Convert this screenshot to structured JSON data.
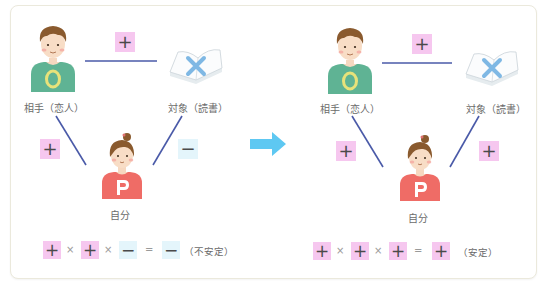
{
  "colors": {
    "plus_bg": "#f6c7ef",
    "minus_bg": "#e4f5fb",
    "line": "#4a5aa8",
    "arrow": "#5ec8f2",
    "partner_shirt": "#5fb394",
    "partner_ring": "#e8e27a",
    "self_shirt": "#ef6c66",
    "book_x": "#7fb8e4"
  },
  "left": {
    "partner_label": "相手（恋人）",
    "partner_shirt_letter": "O",
    "object_label": "対象（読書）",
    "object_mark": "×",
    "self_label": "自分",
    "self_shirt_letter": "P",
    "edge_partner_object": "+",
    "edge_self_partner": "+",
    "edge_self_object": "−",
    "equation": {
      "terms": [
        "+",
        "+",
        "−"
      ],
      "ops": [
        "×",
        "×",
        "="
      ],
      "result": "−",
      "result_note": "（不安定）"
    }
  },
  "right": {
    "partner_label": "相手（恋人）",
    "partner_shirt_letter": "O",
    "object_label": "対象（読書）",
    "object_mark": "×",
    "self_label": "自分",
    "self_shirt_letter": "P",
    "edge_partner_object": "+",
    "edge_self_partner": "+",
    "edge_self_object": "+",
    "equation": {
      "terms": [
        "+",
        "+",
        "+"
      ],
      "ops": [
        "×",
        "×",
        "="
      ],
      "result": "+",
      "result_note": "（安定）"
    }
  },
  "transition_arrow": "right-arrow-icon"
}
